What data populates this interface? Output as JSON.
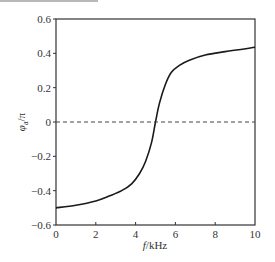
{
  "chart_data": {
    "type": "line",
    "title": "",
    "xlabel": "f/kHz",
    "ylabel": "φa/π",
    "xlim": [
      0,
      10
    ],
    "ylim": [
      -0.6,
      0.6
    ],
    "xticks": [
      0,
      2,
      4,
      6,
      8,
      10
    ],
    "yticks": [
      -0.6,
      -0.4,
      -0.2,
      0,
      0.2,
      0.4,
      0.6
    ],
    "xtick_labels": [
      "0",
      "2",
      "4",
      "6",
      "8",
      "10"
    ],
    "ytick_labels": [
      "−0.6",
      "−0.4",
      "−0.2",
      "0",
      "0.2",
      "0.4",
      "0.6"
    ],
    "grid": false,
    "legend": null,
    "series": [
      {
        "name": "phase",
        "style": "solid",
        "color": "#1a1a1a",
        "x": [
          0,
          1,
          2,
          2.7,
          3.3,
          3.8,
          4.2,
          4.5,
          4.8,
          5.0,
          5.2,
          5.5,
          5.8,
          6.2,
          6.7,
          7.5,
          8.5,
          10
        ],
        "y": [
          -0.5,
          -0.485,
          -0.46,
          -0.43,
          -0.4,
          -0.36,
          -0.3,
          -0.23,
          -0.12,
          0.0,
          0.11,
          0.22,
          0.29,
          0.33,
          0.36,
          0.39,
          0.41,
          0.435
        ]
      },
      {
        "name": "zero-reference",
        "style": "dashed",
        "color": "#444444",
        "x": [
          0,
          10
        ],
        "y": [
          0,
          0
        ]
      }
    ],
    "annotations": []
  },
  "labels": {
    "x_main": "f",
    "x_unit": "/kHz",
    "y_phi": "φ",
    "y_sub": "a",
    "y_rest": "/π"
  }
}
